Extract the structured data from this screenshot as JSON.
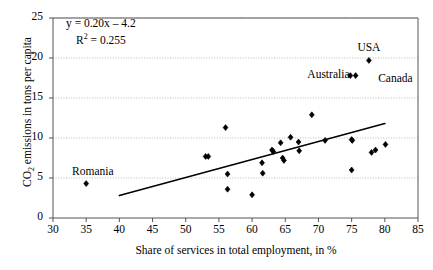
{
  "chart_data": {
    "type": "scatter",
    "title": "",
    "xlabel": "Share of services in total employment, in %",
    "ylabel": "CO2 emissions in tons per capita",
    "xlim": [
      30,
      85
    ],
    "ylim": [
      0,
      25
    ],
    "xticks": [
      30,
      35,
      40,
      45,
      50,
      55,
      60,
      65,
      70,
      75,
      80,
      85
    ],
    "yticks": [
      0,
      5,
      10,
      15,
      20,
      25
    ],
    "grid": "horizontal-dotted",
    "legend": "none",
    "annotations": [
      {
        "text": "y = 0.20x – 4.2",
        "kind": "equation"
      },
      {
        "text": "R² = 0.255",
        "kind": "r-squared"
      },
      {
        "text": "USA",
        "x": 77.6,
        "y": 21.1,
        "kind": "point-label"
      },
      {
        "text": "Australia",
        "x": 71.5,
        "y": 17.8,
        "kind": "point-label"
      },
      {
        "text": "Canada",
        "x": 79.0,
        "y": 17.3,
        "kind": "point-label"
      },
      {
        "text": "Romania",
        "x": 36.0,
        "y": 5.6,
        "kind": "point-label"
      }
    ],
    "trendline": {
      "slope": 0.2,
      "intercept": -4.2,
      "r_squared": 0.255,
      "x_start": 40.0,
      "y_start": 2.8,
      "x_end": 80.0,
      "y_end": 11.8
    },
    "points": [
      {
        "x": 35.0,
        "y": 4.3,
        "label": "Romania"
      },
      {
        "x": 53.0,
        "y": 7.7,
        "label": ""
      },
      {
        "x": 53.4,
        "y": 7.7,
        "label": ""
      },
      {
        "x": 56.0,
        "y": 11.3,
        "label": ""
      },
      {
        "x": 56.3,
        "y": 5.5,
        "label": ""
      },
      {
        "x": 56.3,
        "y": 3.6,
        "label": ""
      },
      {
        "x": 60.0,
        "y": 2.9,
        "label": ""
      },
      {
        "x": 61.5,
        "y": 6.9,
        "label": ""
      },
      {
        "x": 61.6,
        "y": 5.6,
        "label": ""
      },
      {
        "x": 63.0,
        "y": 8.5,
        "label": ""
      },
      {
        "x": 63.2,
        "y": 8.3,
        "label": ""
      },
      {
        "x": 64.3,
        "y": 9.4,
        "label": ""
      },
      {
        "x": 64.6,
        "y": 7.5,
        "label": ""
      },
      {
        "x": 64.8,
        "y": 7.2,
        "label": ""
      },
      {
        "x": 65.8,
        "y": 10.1,
        "label": ""
      },
      {
        "x": 67.0,
        "y": 9.5,
        "label": ""
      },
      {
        "x": 67.1,
        "y": 8.4,
        "label": ""
      },
      {
        "x": 69.0,
        "y": 12.9,
        "label": ""
      },
      {
        "x": 71.0,
        "y": 9.7,
        "label": ""
      },
      {
        "x": 75.0,
        "y": 9.8,
        "label": ""
      },
      {
        "x": 75.1,
        "y": 9.7,
        "label": ""
      },
      {
        "x": 75.0,
        "y": 6.0,
        "label": ""
      },
      {
        "x": 77.6,
        "y": 19.7,
        "label": "USA"
      },
      {
        "x": 74.8,
        "y": 17.8,
        "label": "Australia"
      },
      {
        "x": 75.6,
        "y": 17.8,
        "label": "Canada"
      },
      {
        "x": 78.0,
        "y": 8.2,
        "label": ""
      },
      {
        "x": 78.6,
        "y": 8.5,
        "label": ""
      },
      {
        "x": 80.1,
        "y": 9.2,
        "label": ""
      }
    ]
  },
  "colors": {
    "marker": "#000000",
    "trendline": "#000000",
    "axis": "#555555",
    "grid": "#aaaaaa",
    "background": "#ffffff"
  }
}
